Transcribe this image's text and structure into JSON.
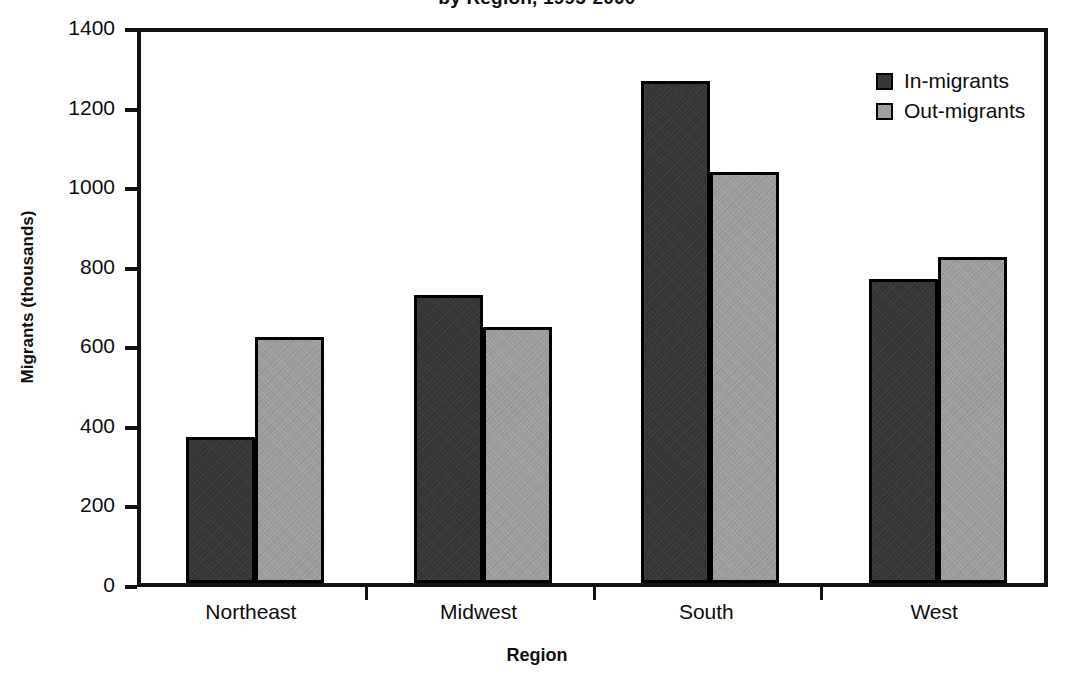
{
  "chart_data": {
    "type": "bar",
    "title": "by Region, 1995-2000",
    "xlabel": "Region",
    "ylabel": "Migrants (thousands)",
    "categories": [
      "Northeast",
      "Midwest",
      "South",
      "West"
    ],
    "series": [
      {
        "name": "In-migrants",
        "color": "#333333",
        "values": [
          367,
          725,
          1263,
          764
        ]
      },
      {
        "name": "Out-migrants",
        "color": "#9b9b9b",
        "values": [
          619,
          644,
          1034,
          820
        ]
      }
    ],
    "ylim": [
      0,
      1400
    ],
    "yticks": [
      0,
      200,
      400,
      600,
      800,
      1000,
      1200,
      1400
    ],
    "ytick_labels": [
      "0",
      "200",
      "400",
      "600",
      "800",
      "1000",
      "1200",
      "1400"
    ],
    "grid": false,
    "legend_position": "top-right"
  },
  "legend": {
    "entries": [
      {
        "label": "In-migrants"
      },
      {
        "label": "Out-migrants"
      }
    ]
  }
}
